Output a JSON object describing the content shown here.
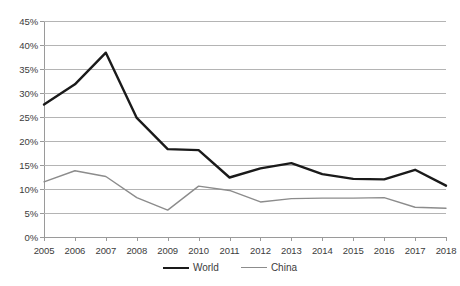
{
  "chart_data": {
    "type": "line",
    "title": "",
    "subtitle": "",
    "xlabel": "",
    "ylabel": "",
    "categories": [
      "2005",
      "2006",
      "2007",
      "2008",
      "2009",
      "2010",
      "2011",
      "2012",
      "2013",
      "2014",
      "2015",
      "2016",
      "2017",
      "2018"
    ],
    "ylim": [
      0,
      45
    ],
    "ytick_labels": [
      "0%",
      "5%",
      "10%",
      "15%",
      "20%",
      "25%",
      "30%",
      "35%",
      "40%",
      "45%"
    ],
    "ytick_values": [
      0,
      5,
      10,
      15,
      20,
      25,
      30,
      35,
      40,
      45
    ],
    "grid": true,
    "legend_position": "bottom",
    "value_suffix": "%",
    "series": [
      {
        "name": "World",
        "color": "#1a1a1a",
        "width": 2.4,
        "values": [
          27.6,
          31.8,
          38.4,
          24.8,
          18.3,
          18.1,
          12.4,
          14.3,
          15.4,
          13.1,
          12.1,
          12.0,
          14.0,
          10.7
        ]
      },
      {
        "name": "China",
        "color": "#8c8c8c",
        "width": 1.4,
        "values": [
          11.5,
          13.8,
          12.6,
          8.2,
          5.6,
          10.6,
          9.7,
          7.3,
          8.0,
          8.1,
          8.1,
          8.2,
          6.2,
          6.0
        ]
      }
    ]
  },
  "legend": {
    "items": [
      {
        "label": "World"
      },
      {
        "label": "China"
      }
    ]
  },
  "colors": {
    "world": "#1a1a1a",
    "china": "#8c8c8c",
    "gridline": "#b4b4b4",
    "axis": "#9a9a9a",
    "text": "#3c3c3c",
    "background": "#ffffff"
  }
}
